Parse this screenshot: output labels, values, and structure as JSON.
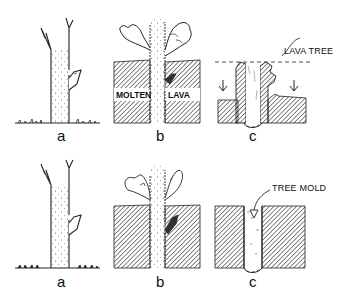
{
  "diagram": {
    "rows": [
      {
        "name": "lava-tree-sequence",
        "panels": [
          {
            "letter": "a",
            "description": "standing tree on ground"
          },
          {
            "letter": "b",
            "description": "tree engulfed by molten lava",
            "labels": [
              "MOLTEN",
              "LAVA"
            ]
          },
          {
            "letter": "c",
            "description": "lava drains, leaving lava tree shell",
            "labels": [
              "LAVA TREE"
            ]
          }
        ]
      },
      {
        "name": "tree-mold-sequence",
        "panels": [
          {
            "letter": "a",
            "description": "standing tree on ground"
          },
          {
            "letter": "b",
            "description": "tree surrounded by lava"
          },
          {
            "letter": "c",
            "description": "tree burns away leaving mold",
            "labels": [
              "TREE MOLD"
            ]
          }
        ]
      }
    ],
    "colors": {
      "ink": "#1a1a1a",
      "background": "#ffffff"
    }
  }
}
